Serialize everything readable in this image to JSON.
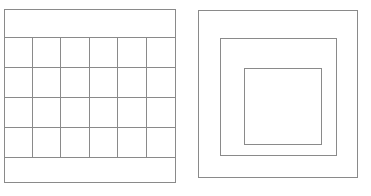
{
  "canvas": {
    "width": 371,
    "height": 196,
    "background_color": "#ffffff",
    "stroke_color": "#8a8a8a",
    "stroke_width": 1
  },
  "figures": [
    {
      "name": "grid-figure",
      "description": "Rectangle divided into a top band, a 6 by 4 cell grid, and a bottom band",
      "outer": {
        "x": 4,
        "y": 9,
        "width": 172,
        "height": 174
      },
      "grid": {
        "x": 4,
        "y": 37,
        "width": 172,
        "height": 120,
        "columns": 6,
        "rows": 4,
        "column_x": [
          4,
          32,
          60,
          89,
          117,
          146,
          176
        ],
        "row_y": [
          37,
          67,
          97,
          127,
          157
        ]
      },
      "top_band": {
        "x": 4,
        "y": 9,
        "width": 172,
        "height": 28
      },
      "bottom_band": {
        "x": 4,
        "y": 157,
        "width": 172,
        "height": 26
      }
    },
    {
      "name": "nested-squares-figure",
      "description": "Three concentric rectangles nested one inside another",
      "rectangles": [
        {
          "name": "outer-rectangle",
          "x": 198,
          "y": 10,
          "width": 160,
          "height": 168
        },
        {
          "name": "middle-rectangle",
          "x": 220,
          "y": 38,
          "width": 117,
          "height": 118
        },
        {
          "name": "inner-rectangle",
          "x": 244,
          "y": 68,
          "width": 78,
          "height": 77
        }
      ]
    }
  ]
}
